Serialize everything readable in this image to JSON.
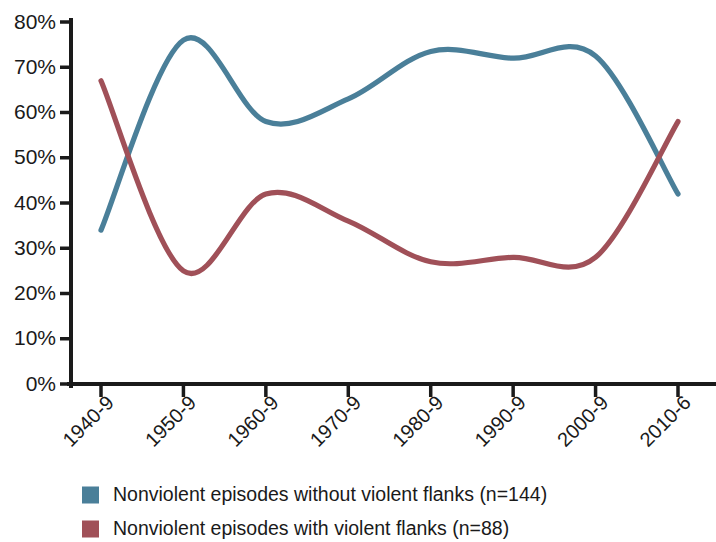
{
  "chart_data": {
    "type": "line",
    "title": "",
    "subtitle": "",
    "xlabel": "",
    "ylabel": "",
    "categories": [
      "1940-9",
      "1950-9",
      "1960-9",
      "1970-9",
      "1980-9",
      "1990-9",
      "2000-9",
      "2010-6"
    ],
    "ylim": [
      0,
      80
    ],
    "y_ticks": [
      0,
      10,
      20,
      30,
      40,
      50,
      60,
      70,
      80
    ],
    "y_tick_labels": [
      "0%",
      "10%",
      "20%",
      "30%",
      "40%",
      "50%",
      "60%",
      "70%",
      "80%"
    ],
    "grid": false,
    "legend_position": "bottom-left",
    "smoothing": "spline",
    "series": [
      {
        "name": "Nonviolent episodes without violent flanks (n=144)",
        "color": "#4a7f99",
        "values": [
          34,
          76,
          58,
          63,
          73.5,
          72,
          72.5,
          42
        ]
      },
      {
        "name": "Nonviolent episodes with violent flanks (n=88)",
        "color": "#a05058",
        "values": [
          67,
          25,
          42,
          36,
          27,
          28,
          28,
          58
        ]
      }
    ]
  },
  "legend": {
    "items": [
      {
        "label": "Nonviolent episodes without violent flanks (n=144)",
        "color": "#4a7f99",
        "swatch_name": "legend-swatch-blue"
      },
      {
        "label": "Nonviolent episodes with violent flanks (n=88)",
        "color": "#a05058",
        "swatch_name": "legend-swatch-red"
      }
    ]
  }
}
